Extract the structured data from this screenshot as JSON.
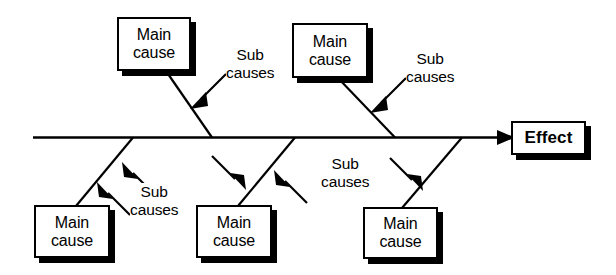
{
  "diagram": {
    "type": "fishbone-ishikawa-diagram",
    "ink_color": "#000000",
    "background_color": "#ffffff",
    "effect": {
      "label": "Effect",
      "position": "right-end-of-spine"
    },
    "main_causes": [
      {
        "id": "top-left",
        "line1": "Main",
        "line2": "cause",
        "position": "upper-left"
      },
      {
        "id": "top-right",
        "line1": "Main",
        "line2": "cause",
        "position": "upper-right"
      },
      {
        "id": "bottom-left",
        "line1": "Main",
        "line2": "cause",
        "position": "lower-left"
      },
      {
        "id": "bottom-middle",
        "line1": "Main",
        "line2": "cause",
        "position": "lower-middle"
      },
      {
        "id": "bottom-right",
        "line1": "Main",
        "line2": "cause",
        "position": "lower-right"
      }
    ],
    "sub_cause_labels": [
      {
        "id": "sub-top-left",
        "line1": "Sub",
        "line2": "causes",
        "arrow_count": 1,
        "points_to": "top-left-rib"
      },
      {
        "id": "sub-top-right",
        "line1": "Sub",
        "line2": "causes",
        "arrow_count": 1,
        "points_to": "top-right-rib"
      },
      {
        "id": "sub-bottom-left",
        "line1": "Sub",
        "line2": "causes",
        "arrow_count": 2,
        "points_to": "bottom-left-rib"
      },
      {
        "id": "sub-bottom-middle",
        "line1": "Sub",
        "line2": "causes",
        "arrow_count": 2,
        "points_to": "bottom-middle-rib"
      }
    ],
    "spine": {
      "description": "Horizontal backbone arrow running left to right into the Effect box"
    }
  }
}
